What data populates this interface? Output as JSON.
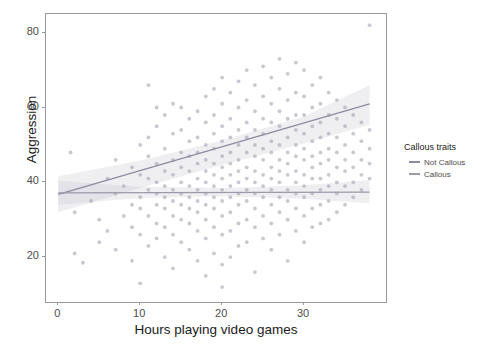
{
  "chart_data": {
    "type": "scatter",
    "title": "",
    "xlabel": "Hours playing video games",
    "ylabel": "Aggression",
    "xlim": [
      -1.5,
      40
    ],
    "ylim": [
      8,
      85
    ],
    "xticks": [
      "0",
      "10",
      "20",
      "30"
    ],
    "xtick_values": [
      0,
      10,
      20,
      30
    ],
    "yticks": [
      "20",
      "40",
      "60",
      "80"
    ],
    "ytick_values": [
      20,
      40,
      60,
      80
    ],
    "grid": false,
    "legend_position": "right",
    "legend_title": "Callous traits",
    "series": [
      {
        "name": "Not Callous",
        "color": "#8c8c9e",
        "fit": "linear",
        "fit_points": [
          [
            0,
            36.8
          ],
          [
            38,
            61.0
          ]
        ],
        "ribbon_lower": [
          [
            0,
            32.0
          ],
          [
            10,
            38.5
          ],
          [
            20,
            44.6
          ],
          [
            30,
            50.4
          ],
          [
            38,
            55.4
          ]
        ],
        "ribbon_upper": [
          [
            0,
            41.6
          ],
          [
            10,
            45.8
          ],
          [
            20,
            51.2
          ],
          [
            30,
            57.6
          ],
          [
            38,
            66.0
          ]
        ]
      },
      {
        "name": "Callous",
        "color": "#9a9aa8",
        "fit": "linear",
        "fit_points": [
          [
            0,
            37.2
          ],
          [
            38,
            37.4
          ]
        ],
        "ribbon_lower": [
          [
            0,
            34.0
          ],
          [
            10,
            35.8
          ],
          [
            20,
            36.3
          ],
          [
            30,
            35.6
          ],
          [
            38,
            34.4
          ]
        ],
        "ribbon_upper": [
          [
            0,
            40.4
          ],
          [
            10,
            38.8
          ],
          [
            20,
            38.5
          ],
          [
            30,
            39.2
          ],
          [
            38,
            40.6
          ]
        ]
      }
    ],
    "points": [
      [
        1.5,
        48
      ],
      [
        2,
        21
      ],
      [
        2,
        32
      ],
      [
        3,
        18.5
      ],
      [
        4,
        35
      ],
      [
        5,
        30
      ],
      [
        5,
        24
      ],
      [
        6,
        41
      ],
      [
        6,
        27
      ],
      [
        7,
        37
      ],
      [
        7,
        46
      ],
      [
        7,
        22
      ],
      [
        8,
        31
      ],
      [
        8,
        39
      ],
      [
        9,
        44
      ],
      [
        9,
        28
      ],
      [
        9,
        34
      ],
      [
        9,
        19
      ],
      [
        10,
        50
      ],
      [
        10,
        42
      ],
      [
        10,
        36
      ],
      [
        10,
        33
      ],
      [
        10,
        26
      ],
      [
        10,
        13
      ],
      [
        11,
        66
      ],
      [
        11,
        52
      ],
      [
        11,
        47
      ],
      [
        11,
        41
      ],
      [
        11,
        38
      ],
      [
        11,
        31
      ],
      [
        11,
        23
      ],
      [
        12,
        60
      ],
      [
        12,
        55
      ],
      [
        12,
        45
      ],
      [
        12,
        40
      ],
      [
        12,
        37
      ],
      [
        12,
        34
      ],
      [
        12,
        29
      ],
      [
        12,
        25
      ],
      [
        13,
        58
      ],
      [
        13,
        49
      ],
      [
        13,
        43
      ],
      [
        13,
        39
      ],
      [
        13,
        36
      ],
      [
        13,
        33
      ],
      [
        13,
        28
      ],
      [
        13,
        20
      ],
      [
        14,
        61
      ],
      [
        14,
        53
      ],
      [
        14,
        46
      ],
      [
        14,
        42
      ],
      [
        14,
        38
      ],
      [
        14,
        35
      ],
      [
        14,
        31
      ],
      [
        14,
        26
      ],
      [
        14,
        17
      ],
      [
        15,
        60
      ],
      [
        15,
        54
      ],
      [
        15,
        48
      ],
      [
        15,
        44
      ],
      [
        15,
        40
      ],
      [
        15,
        37
      ],
      [
        15,
        34
      ],
      [
        15,
        30
      ],
      [
        15,
        24
      ],
      [
        16,
        57
      ],
      [
        16,
        51
      ],
      [
        16,
        47
      ],
      [
        16,
        43
      ],
      [
        16,
        39
      ],
      [
        16,
        36
      ],
      [
        16,
        33
      ],
      [
        16,
        29
      ],
      [
        16,
        22
      ],
      [
        17,
        59
      ],
      [
        17,
        52
      ],
      [
        17,
        48
      ],
      [
        17,
        45
      ],
      [
        17,
        41
      ],
      [
        17,
        38
      ],
      [
        17,
        35
      ],
      [
        17,
        32
      ],
      [
        17,
        27
      ],
      [
        17,
        19
      ],
      [
        18,
        63
      ],
      [
        18,
        56
      ],
      [
        18,
        50
      ],
      [
        18,
        46
      ],
      [
        18,
        43
      ],
      [
        18,
        40
      ],
      [
        18,
        37
      ],
      [
        18,
        34
      ],
      [
        18,
        30
      ],
      [
        18,
        25
      ],
      [
        18,
        15
      ],
      [
        19,
        65
      ],
      [
        19,
        58
      ],
      [
        19,
        53
      ],
      [
        19,
        49
      ],
      [
        19,
        45
      ],
      [
        19,
        42
      ],
      [
        19,
        39
      ],
      [
        19,
        36
      ],
      [
        19,
        33
      ],
      [
        19,
        28
      ],
      [
        19,
        21
      ],
      [
        20,
        68
      ],
      [
        20,
        61
      ],
      [
        20,
        55
      ],
      [
        20,
        51
      ],
      [
        20,
        47
      ],
      [
        20,
        44
      ],
      [
        20,
        41
      ],
      [
        20,
        38
      ],
      [
        20,
        35
      ],
      [
        20,
        31
      ],
      [
        20,
        26
      ],
      [
        20,
        18
      ],
      [
        20,
        12
      ],
      [
        21,
        64
      ],
      [
        21,
        57
      ],
      [
        21,
        52
      ],
      [
        21,
        48
      ],
      [
        21,
        45
      ],
      [
        21,
        42
      ],
      [
        21,
        39
      ],
      [
        21,
        36
      ],
      [
        21,
        32
      ],
      [
        21,
        27
      ],
      [
        21,
        20
      ],
      [
        22,
        67
      ],
      [
        22,
        60
      ],
      [
        22,
        54
      ],
      [
        22,
        50
      ],
      [
        22,
        46
      ],
      [
        22,
        43
      ],
      [
        22,
        40
      ],
      [
        22,
        37
      ],
      [
        22,
        34
      ],
      [
        22,
        29
      ],
      [
        22,
        23
      ],
      [
        23,
        70
      ],
      [
        23,
        62
      ],
      [
        23,
        56
      ],
      [
        23,
        52
      ],
      [
        23,
        48
      ],
      [
        23,
        44
      ],
      [
        23,
        41
      ],
      [
        23,
        38
      ],
      [
        23,
        35
      ],
      [
        23,
        30
      ],
      [
        23,
        24
      ],
      [
        24,
        66
      ],
      [
        24,
        59
      ],
      [
        24,
        54
      ],
      [
        24,
        50
      ],
      [
        24,
        47
      ],
      [
        24,
        43
      ],
      [
        24,
        40
      ],
      [
        24,
        37
      ],
      [
        24,
        33
      ],
      [
        24,
        28
      ],
      [
        24,
        16
      ],
      [
        25,
        71
      ],
      [
        25,
        63
      ],
      [
        25,
        57
      ],
      [
        25,
        53
      ],
      [
        25,
        49
      ],
      [
        25,
        46
      ],
      [
        25,
        42
      ],
      [
        25,
        39
      ],
      [
        25,
        36
      ],
      [
        25,
        31
      ],
      [
        25,
        25
      ],
      [
        26,
        68
      ],
      [
        26,
        61
      ],
      [
        26,
        56
      ],
      [
        26,
        51
      ],
      [
        26,
        48
      ],
      [
        26,
        44
      ],
      [
        26,
        41
      ],
      [
        26,
        38
      ],
      [
        26,
        34
      ],
      [
        26,
        29
      ],
      [
        26,
        22
      ],
      [
        27,
        73
      ],
      [
        27,
        65
      ],
      [
        27,
        59
      ],
      [
        27,
        55
      ],
      [
        27,
        50
      ],
      [
        27,
        46
      ],
      [
        27,
        43
      ],
      [
        27,
        40
      ],
      [
        27,
        36
      ],
      [
        27,
        32
      ],
      [
        27,
        26
      ],
      [
        28,
        69
      ],
      [
        28,
        62
      ],
      [
        28,
        57
      ],
      [
        28,
        52
      ],
      [
        28,
        48
      ],
      [
        28,
        45
      ],
      [
        28,
        42
      ],
      [
        28,
        38
      ],
      [
        28,
        35
      ],
      [
        28,
        30
      ],
      [
        28,
        19
      ],
      [
        29,
        72
      ],
      [
        29,
        64
      ],
      [
        29,
        58
      ],
      [
        29,
        54
      ],
      [
        29,
        50
      ],
      [
        29,
        47
      ],
      [
        29,
        43
      ],
      [
        29,
        40
      ],
      [
        29,
        37
      ],
      [
        29,
        33
      ],
      [
        29,
        27
      ],
      [
        30,
        70
      ],
      [
        30,
        63
      ],
      [
        30,
        58
      ],
      [
        30,
        53
      ],
      [
        30,
        49
      ],
      [
        30,
        46
      ],
      [
        30,
        42
      ],
      [
        30,
        39
      ],
      [
        30,
        36
      ],
      [
        30,
        31
      ],
      [
        30,
        24
      ],
      [
        31,
        66
      ],
      [
        31,
        60
      ],
      [
        31,
        55
      ],
      [
        31,
        51
      ],
      [
        31,
        47
      ],
      [
        31,
        44
      ],
      [
        31,
        41
      ],
      [
        31,
        37
      ],
      [
        31,
        33
      ],
      [
        31,
        28
      ],
      [
        32,
        68
      ],
      [
        32,
        61
      ],
      [
        32,
        56
      ],
      [
        32,
        52
      ],
      [
        32,
        48
      ],
      [
        32,
        45
      ],
      [
        32,
        41
      ],
      [
        32,
        38
      ],
      [
        32,
        34
      ],
      [
        32,
        29
      ],
      [
        33,
        64
      ],
      [
        33,
        58
      ],
      [
        33,
        53
      ],
      [
        33,
        49
      ],
      [
        33,
        46
      ],
      [
        33,
        42
      ],
      [
        33,
        39
      ],
      [
        33,
        35
      ],
      [
        33,
        30
      ],
      [
        34,
        62
      ],
      [
        34,
        57
      ],
      [
        34,
        52
      ],
      [
        34,
        48
      ],
      [
        34,
        44
      ],
      [
        34,
        40
      ],
      [
        34,
        37
      ],
      [
        34,
        32
      ],
      [
        35,
        60
      ],
      [
        35,
        55
      ],
      [
        35,
        50
      ],
      [
        35,
        46
      ],
      [
        35,
        43
      ],
      [
        35,
        39
      ],
      [
        35,
        34
      ],
      [
        36,
        58
      ],
      [
        36,
        53
      ],
      [
        36,
        48
      ],
      [
        36,
        44
      ],
      [
        36,
        40
      ],
      [
        36,
        36
      ],
      [
        37,
        56
      ],
      [
        37,
        51
      ],
      [
        37,
        46
      ],
      [
        37,
        42
      ],
      [
        37,
        38
      ],
      [
        38,
        82
      ],
      [
        38,
        54
      ],
      [
        38,
        49
      ],
      [
        38,
        45
      ],
      [
        38,
        41
      ]
    ],
    "point_color": "#9b9bac",
    "point_opacity": 0.55,
    "panel_border_color": "#9a9a9a",
    "background": "#ffffff"
  }
}
